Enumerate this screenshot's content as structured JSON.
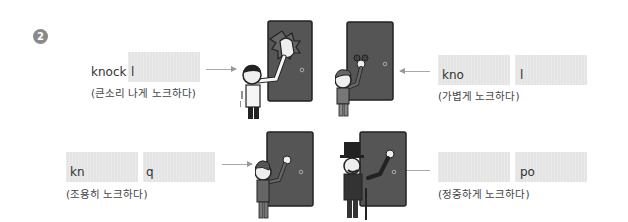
{
  "exercise": {
    "number": "2"
  },
  "items": [
    {
      "id": "loud",
      "prompt_start": "knock",
      "prompt_letter": "l",
      "gloss": "(큰소리 나게 노크하다)"
    },
    {
      "id": "light",
      "prompt_start": "kno",
      "prompt_letter": "l",
      "gloss": "(가볍게 노크하다)"
    },
    {
      "id": "quiet",
      "prompt_start": "kn",
      "prompt_letter": "q",
      "gloss": "(조용히 노크하다)"
    },
    {
      "id": "polite",
      "prompt_start": "",
      "prompt_letter": "po",
      "gloss": "(정중하게 노크하다)"
    }
  ],
  "illustrations": [
    {
      "name": "man-banging-door",
      "description": "loud knock"
    },
    {
      "name": "boy-tapping-door",
      "description": "light knock"
    },
    {
      "name": "man-quietly-knocking",
      "description": "quiet knock"
    },
    {
      "name": "gentleman-top-hat-knocking",
      "description": "polite knock"
    }
  ],
  "colors": {
    "door": "#555555",
    "blank_fill": "#e4e4e4",
    "badge": "#8a8a8a",
    "arrow": "#aaaaaa"
  }
}
